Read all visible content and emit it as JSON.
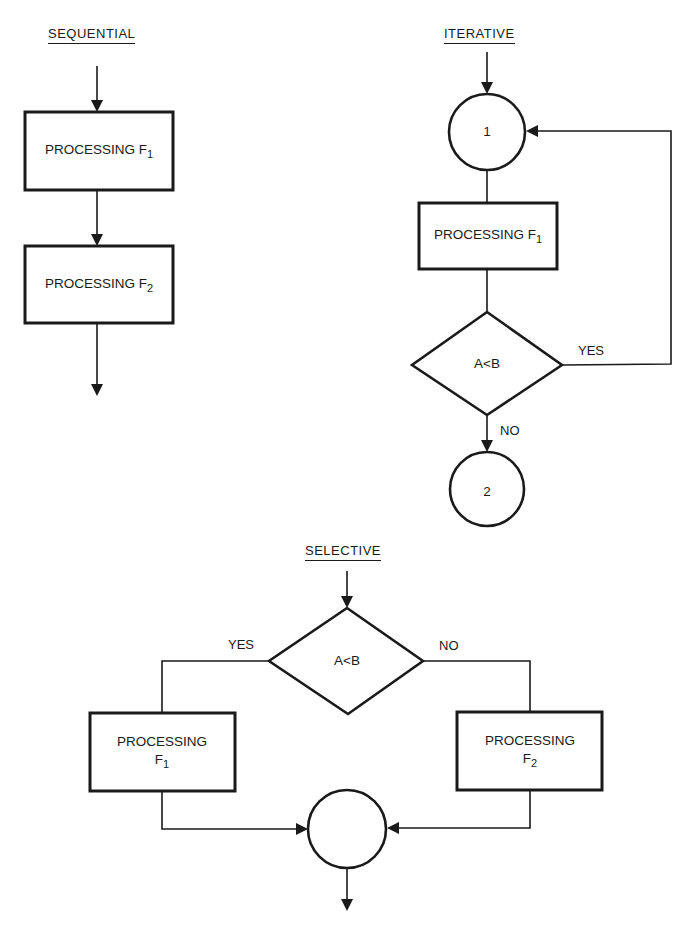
{
  "diagram": {
    "background": "#ffffff",
    "ink_color": "#1a1a1a",
    "sections": {
      "sequential": {
        "title": "SEQUENTIAL",
        "nodes": [
          {
            "id": "seq-p1",
            "type": "process",
            "text": "PROCESSING F",
            "sub": "1"
          },
          {
            "id": "seq-p2",
            "type": "process",
            "text": "PROCESSING F",
            "sub": "2"
          }
        ]
      },
      "iterative": {
        "title": "ITERATIVE",
        "nodes": [
          {
            "id": "it-c1",
            "type": "connector",
            "text": "1"
          },
          {
            "id": "it-p1",
            "type": "process",
            "text": "PROCESSING F",
            "sub": "1"
          },
          {
            "id": "it-d1",
            "type": "decision",
            "text": "A<B"
          },
          {
            "id": "it-c2",
            "type": "connector",
            "text": "2"
          }
        ],
        "edge_labels": {
          "yes": "YES",
          "no": "NO"
        }
      },
      "selective": {
        "title": "SELECTIVE",
        "nodes": [
          {
            "id": "sel-d1",
            "type": "decision",
            "text": "A<B"
          },
          {
            "id": "sel-p1",
            "type": "process",
            "text": "PROCESSING",
            "line2": "F",
            "sub": "1"
          },
          {
            "id": "sel-p2",
            "type": "process",
            "text": "PROCESSING",
            "line2": "F",
            "sub": "2"
          },
          {
            "id": "sel-c1",
            "type": "connector",
            "text": ""
          }
        ],
        "edge_labels": {
          "yes": "YES",
          "no": "NO"
        }
      }
    }
  }
}
